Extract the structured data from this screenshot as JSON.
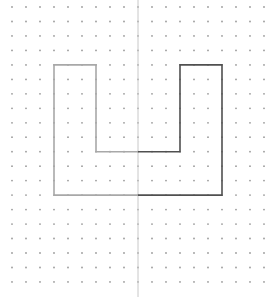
{
  "grid": {
    "cols": 19,
    "rows": 20,
    "x0": 12,
    "y0": 7,
    "dx": 14,
    "dy": 14.47,
    "dot_radius": 0.9,
    "dot_color": "#9a9a9a"
  },
  "mirror_line": {
    "x": 138,
    "color": "#c8c8c8"
  },
  "shape": {
    "points_grid": [
      [
        3,
        4
      ],
      [
        6,
        4
      ],
      [
        6,
        10
      ],
      [
        12,
        10
      ],
      [
        12,
        4
      ],
      [
        15,
        4
      ],
      [
        15,
        13
      ],
      [
        3,
        13
      ]
    ],
    "left_color": "#a8a8a8",
    "right_color": "#505050",
    "stroke_width": 1.6
  }
}
